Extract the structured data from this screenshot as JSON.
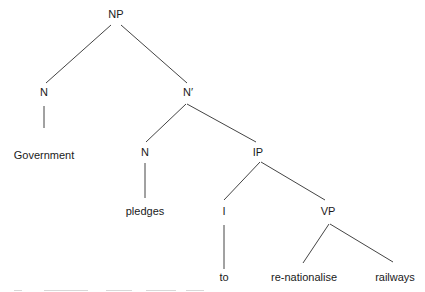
{
  "diagram": {
    "type": "syntax-tree",
    "line_color": "#444444",
    "text_color": "#1a1a1a",
    "nodes": [
      {
        "id": "np",
        "label": "NP",
        "x": 116,
        "y": 14,
        "kind": "phrase"
      },
      {
        "id": "n1",
        "label": "N",
        "x": 44,
        "y": 92,
        "kind": "head"
      },
      {
        "id": "nbar",
        "label": "N′",
        "x": 188,
        "y": 92,
        "kind": "phrase"
      },
      {
        "id": "gov",
        "label": "Government",
        "x": 44,
        "y": 155,
        "kind": "word"
      },
      {
        "id": "n2",
        "label": "N",
        "x": 145,
        "y": 152,
        "kind": "head"
      },
      {
        "id": "ip",
        "label": "IP",
        "x": 258,
        "y": 152,
        "kind": "phrase"
      },
      {
        "id": "pledges",
        "label": "pledges",
        "x": 145,
        "y": 211,
        "kind": "word"
      },
      {
        "id": "i",
        "label": "I",
        "x": 224,
        "y": 211,
        "kind": "head"
      },
      {
        "id": "vp",
        "label": "VP",
        "x": 328,
        "y": 211,
        "kind": "phrase"
      },
      {
        "id": "to",
        "label": "to",
        "x": 224,
        "y": 277,
        "kind": "word"
      },
      {
        "id": "renat",
        "label": "re-nationalise",
        "x": 304,
        "y": 277,
        "kind": "word"
      },
      {
        "id": "railways",
        "label": "railways",
        "x": 395,
        "y": 277,
        "kind": "word"
      }
    ],
    "edges": [
      {
        "from": "np",
        "to": "n1",
        "x1": 111,
        "y1": 25,
        "x2": 46,
        "y2": 83
      },
      {
        "from": "np",
        "to": "nbar",
        "x1": 121,
        "y1": 25,
        "x2": 187,
        "y2": 83
      },
      {
        "from": "n1",
        "to": "gov",
        "x1": 44,
        "y1": 106,
        "x2": 44,
        "y2": 128
      },
      {
        "from": "nbar",
        "to": "n2",
        "x1": 186,
        "y1": 104,
        "x2": 146,
        "y2": 142
      },
      {
        "from": "nbar",
        "to": "ip",
        "x1": 187,
        "y1": 104,
        "x2": 256,
        "y2": 142
      },
      {
        "from": "n2",
        "to": "pledges",
        "x1": 145,
        "y1": 163,
        "x2": 145,
        "y2": 198
      },
      {
        "from": "ip",
        "to": "i",
        "x1": 260,
        "y1": 162,
        "x2": 224,
        "y2": 200
      },
      {
        "from": "ip",
        "to": "vp",
        "x1": 261,
        "y1": 162,
        "x2": 325,
        "y2": 200
      },
      {
        "from": "i",
        "to": "to",
        "x1": 224,
        "y1": 225,
        "x2": 224,
        "y2": 269
      },
      {
        "from": "vp",
        "to": "renat",
        "x1": 329,
        "y1": 224,
        "x2": 303,
        "y2": 263
      },
      {
        "from": "vp",
        "to": "railways",
        "x1": 330,
        "y1": 224,
        "x2": 393,
        "y2": 262
      }
    ]
  }
}
